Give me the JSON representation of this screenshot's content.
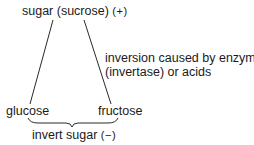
{
  "diagram": {
    "top": {
      "label": "sugar (sucrose)",
      "sign": "(+)"
    },
    "annotation": {
      "line1": "inversion caused by enzyme",
      "line2": "(invertase) or acids"
    },
    "products": [
      {
        "label": "glucose"
      },
      {
        "label": "fructose"
      }
    ],
    "bottom": {
      "label": "invert sugar",
      "sign": "(−)"
    },
    "colors": {
      "line": "#2a2a2a",
      "text": "#1a1a1a"
    }
  }
}
